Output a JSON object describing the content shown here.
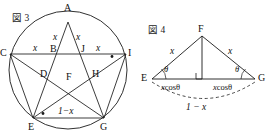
{
  "sheet": {
    "width": 270,
    "height": 138,
    "background": "#ffffff",
    "ink": "#1a1a1a"
  },
  "figures": [
    {
      "id": "fig3",
      "caption": "図 3",
      "description": "circle with inscribed star polygon, vertices A C E G I and inner intersection points B D F H J",
      "circle": {
        "cx": 68,
        "cy": 70,
        "r": 59
      },
      "points": [
        {
          "name": "A",
          "label": "A",
          "x": 68,
          "y": 22,
          "label_x": 64,
          "label_y": 3
        },
        {
          "name": "C",
          "label": "C",
          "x": 10,
          "y": 54,
          "label_x": 0,
          "label_y": 48
        },
        {
          "name": "I",
          "label": "I",
          "x": 126,
          "y": 54,
          "label_x": 128,
          "label_y": 48
        },
        {
          "name": "E",
          "label": "E",
          "x": 33,
          "y": 118,
          "label_x": 28,
          "label_y": 122
        },
        {
          "name": "G",
          "label": "G",
          "x": 104,
          "y": 118,
          "label_x": 100,
          "label_y": 122
        },
        {
          "name": "B",
          "label": "B",
          "x": 56,
          "y": 54,
          "label_x": 50,
          "label_y": 44
        },
        {
          "name": "J",
          "label": "J",
          "x": 84,
          "y": 54,
          "label_x": 81,
          "label_y": 44
        },
        {
          "name": "D",
          "label": "D",
          "x": 47,
          "y": 76,
          "label_x": 40,
          "label_y": 69
        },
        {
          "name": "F",
          "label": "F",
          "x": 70,
          "y": 81,
          "label_x": 66,
          "label_y": 72
        },
        {
          "name": "H",
          "label": "H",
          "x": 93,
          "y": 76,
          "label_x": 92,
          "label_y": 69
        }
      ],
      "chords": [
        [
          "A",
          "E"
        ],
        [
          "A",
          "G"
        ],
        [
          "C",
          "I"
        ],
        [
          "C",
          "G"
        ],
        [
          "E",
          "I"
        ],
        [
          "E",
          "G"
        ]
      ],
      "length_labels": [
        {
          "text": "x",
          "x": 53,
          "y": 33,
          "for": "A-B"
        },
        {
          "text": "x",
          "x": 76,
          "y": 33,
          "for": "A-J"
        },
        {
          "text": "x",
          "x": 33,
          "y": 44,
          "for": "C-B"
        },
        {
          "text": "x",
          "x": 96,
          "y": 44,
          "for": "J-I"
        },
        {
          "text": "1−x",
          "x": 58,
          "y": 107,
          "for": "E-G"
        }
      ],
      "tick_dots": [
        {
          "x": 112,
          "y": 56
        },
        {
          "x": 43,
          "y": 113
        }
      ]
    },
    {
      "id": "fig4",
      "caption": "図 4",
      "description": "isosceles triangle E F G with apex F, equal sides x, base angles theta, base split into two segments x cos theta, total base 1 minus x shown on dashed arc",
      "points": [
        {
          "name": "F",
          "label": "F",
          "x": 62,
          "y": 36,
          "label_x": 58,
          "label_y": 24
        },
        {
          "name": "E",
          "label": "E",
          "x": 12,
          "y": 79,
          "label_x": 1,
          "label_y": 73
        },
        {
          "name": "G",
          "label": "G",
          "x": 115,
          "y": 79,
          "label_x": 118,
          "label_y": 73
        },
        {
          "name": "M",
          "label": "",
          "x": 62,
          "y": 79,
          "label_x": 0,
          "label_y": 0
        }
      ],
      "sides": [
        [
          "E",
          "F"
        ],
        [
          "F",
          "G"
        ],
        [
          "E",
          "G"
        ],
        [
          "F",
          "M"
        ]
      ],
      "length_labels": [
        {
          "text": "x",
          "x": 30,
          "y": 47,
          "for": "E-F"
        },
        {
          "text": "x",
          "x": 88,
          "y": 47,
          "for": "F-G"
        }
      ],
      "angle_labels": [
        {
          "text": "θ",
          "x": 24,
          "y": 66,
          "for": "angle-E"
        },
        {
          "text": "θ",
          "x": 95,
          "y": 66,
          "for": "angle-G"
        }
      ],
      "trig_labels": [
        {
          "prefix": "x",
          "suffix": "cosθ",
          "x": 22,
          "y": 83,
          "for": "E-M"
        },
        {
          "prefix": "x",
          "suffix": "cosθ",
          "x": 74,
          "y": 83,
          "for": "M-G"
        }
      ],
      "base_label": {
        "text": "1 − x",
        "x": 47,
        "y": 104
      },
      "right_angle": {
        "x": 62,
        "y": 79,
        "size": 6
      },
      "dashed_arc": {
        "from_x": 12,
        "from_y": 82,
        "to_x": 115,
        "to_y": 82,
        "sag": 22
      }
    }
  ]
}
